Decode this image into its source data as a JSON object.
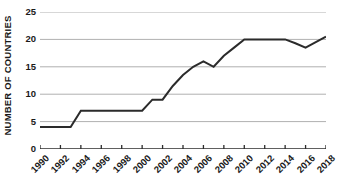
{
  "chart_data": {
    "type": "line",
    "title": "",
    "subtitle": "",
    "xlabel": "",
    "ylabel": "NUMBER OF COUNTRIES",
    "xlim": [
      1990,
      2018
    ],
    "ylim": [
      0,
      25
    ],
    "grid": true,
    "legend": false,
    "legend_position": "none",
    "y_ticks": [
      0,
      5,
      10,
      15,
      20,
      25
    ],
    "y_tick_labels": [
      "0",
      "5",
      "10",
      "15",
      "20",
      "25"
    ],
    "x_ticks": [
      1990,
      1992,
      1994,
      1996,
      1998,
      2000,
      2002,
      2004,
      2006,
      2008,
      2010,
      2012,
      2014,
      2016,
      2018
    ],
    "x_tick_labels": [
      "1990",
      "1992",
      "1994",
      "1996",
      "1998",
      "2000",
      "2002",
      "2004",
      "2006",
      "2008",
      "2010",
      "2012",
      "2014",
      "2016",
      "2018"
    ],
    "x": [
      1990,
      1991,
      1992,
      1993,
      1994,
      1995,
      1996,
      1997,
      1998,
      1999,
      2000,
      2001,
      2002,
      2003,
      2004,
      2005,
      2006,
      2007,
      2008,
      2009,
      2010,
      2011,
      2012,
      2013,
      2014,
      2015,
      2016,
      2017,
      2018
    ],
    "values": [
      4,
      4,
      4,
      4,
      7,
      7,
      7,
      7,
      7,
      7,
      7,
      9,
      9,
      11.5,
      13.5,
      15,
      16,
      15,
      17,
      18.5,
      20,
      20,
      20,
      20,
      20,
      19.3,
      18.5,
      19.5,
      20.5
    ],
    "series": [
      {
        "name": "Number of countries",
        "color": "#2b2b2b",
        "values": [
          4,
          4,
          4,
          4,
          7,
          7,
          7,
          7,
          7,
          7,
          7,
          9,
          9,
          11.5,
          13.5,
          15,
          16,
          15,
          17,
          18.5,
          20,
          20,
          20,
          20,
          20,
          19.3,
          18.5,
          19.5,
          20.5
        ]
      }
    ],
    "colors": {
      "line": "#2b2b2b",
      "gridline": "#b0b0b0",
      "axis": "#2b2b2b",
      "text": "#1a1a1a",
      "background": "#ffffff"
    }
  }
}
